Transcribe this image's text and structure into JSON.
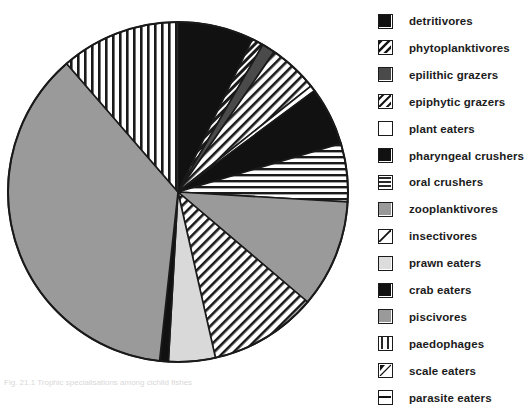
{
  "figure": {
    "caption": "Fig. 21.1  Trophic specialisations among cichlid fishes"
  },
  "chart_data": {
    "type": "pie",
    "title": "",
    "legend_position": "right",
    "start_angle_deg": 0,
    "direction": "clockwise",
    "center": {
      "x": 178,
      "y": 192
    },
    "radius": 170,
    "categories": [
      "detritivores",
      "phytoplanktivores",
      "epilithic grazers",
      "epiphytic grazers",
      "plant eaters",
      "pharyngeal crushers",
      "oral crushers",
      "zooplanktivores",
      "insectivores",
      "prawn eaters",
      "crab eaters",
      "piscivores",
      "paedophages",
      "scale eaters",
      "parasite eaters"
    ],
    "values": [
      26,
      4,
      4.5,
      17,
      2,
      20,
      20,
      37,
      37,
      16,
      3,
      133,
      41,
      0,
      0
    ],
    "angles_deg": [
      26,
      4,
      4.5,
      17,
      2,
      20,
      20,
      37,
      37,
      16,
      3,
      133,
      41,
      0,
      0
    ],
    "fills": [
      "solid-black",
      "diagonal-hatch-dark",
      "solid-darkgray",
      "diagonal-hatch",
      "solid-white",
      "solid-black",
      "horizontal-lines",
      "solid-gray",
      "diagonal-hatch",
      "solid-lightgray",
      "solid-black",
      "solid-gray",
      "vertical-lines",
      "diagonal-corner",
      "horizontal-split"
    ],
    "colors": {
      "black": "#111111",
      "dark_gray": "#4a4a4a",
      "gray": "#9a9a9a",
      "light_gray": "#d6d6d6",
      "white": "#ffffff",
      "outline": "#1a1a1a"
    }
  },
  "legend": {
    "items": [
      {
        "label": "detritivores",
        "swatch": "swatch-solid-black"
      },
      {
        "label": "phytoplanktivores",
        "swatch": "swatch-diagonal-hatch-dark"
      },
      {
        "label": "epilithic grazers",
        "swatch": "swatch-solid-darkgray"
      },
      {
        "label": "epiphytic grazers",
        "swatch": "swatch-diagonal-hatch"
      },
      {
        "label": "plant eaters",
        "swatch": "swatch-solid-white"
      },
      {
        "label": "pharyngeal crushers",
        "swatch": "swatch-solid-black"
      },
      {
        "label": "oral crushers",
        "swatch": "swatch-horizontal-lines"
      },
      {
        "label": "zooplanktivores",
        "swatch": "swatch-solid-gray"
      },
      {
        "label": "insectivores",
        "swatch": "swatch-diagonal-corner"
      },
      {
        "label": "prawn eaters",
        "swatch": "swatch-solid-lightgray"
      },
      {
        "label": "crab eaters",
        "swatch": "swatch-solid-black"
      },
      {
        "label": "piscivores",
        "swatch": "swatch-solid-gray"
      },
      {
        "label": "paedophages",
        "swatch": "swatch-vertical-lines"
      },
      {
        "label": "scale eaters",
        "swatch": "swatch-diagonal-corner-mark"
      },
      {
        "label": "parasite eaters",
        "swatch": "swatch-horizontal-split"
      }
    ]
  }
}
